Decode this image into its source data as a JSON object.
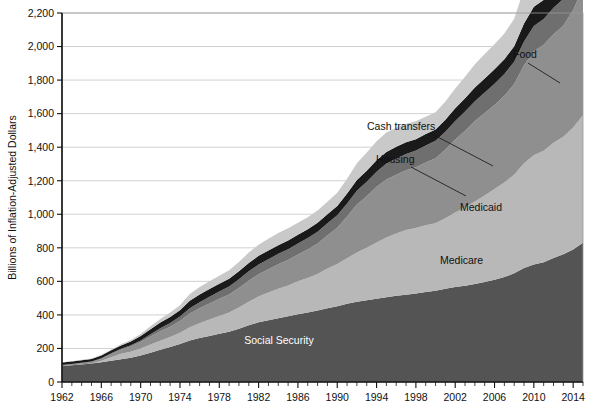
{
  "chart_data": {
    "type": "area",
    "title": "",
    "subtitle": "",
    "xlabel": "",
    "ylabel": "Billions of Inflation-Adjusted Dollars",
    "stacked": true,
    "grid": true,
    "legend_position": "inline-annotations",
    "xlim": [
      1962,
      2015
    ],
    "ylim": [
      0,
      2200
    ],
    "yticks": [
      "0",
      "200",
      "400",
      "600",
      "800",
      "1,000",
      "1,200",
      "1,400",
      "1,600",
      "1,800",
      "2,000",
      "2,200"
    ],
    "ytick_values": [
      0,
      200,
      400,
      600,
      800,
      1000,
      1200,
      1400,
      1600,
      1800,
      2000,
      2200
    ],
    "xticks": [
      "1962",
      "1966",
      "1970",
      "1974",
      "1978",
      "1982",
      "1986",
      "1990",
      "1994",
      "1998",
      "2002",
      "2006",
      "2010",
      "2014"
    ],
    "xtick_values": [
      1962,
      1966,
      1970,
      1974,
      1978,
      1982,
      1986,
      1990,
      1994,
      1998,
      2002,
      2006,
      2010,
      2014
    ],
    "x": [
      1962,
      1963,
      1964,
      1965,
      1966,
      1967,
      1968,
      1969,
      1970,
      1971,
      1972,
      1973,
      1974,
      1975,
      1976,
      1977,
      1978,
      1979,
      1980,
      1981,
      1982,
      1983,
      1984,
      1985,
      1986,
      1987,
      1988,
      1989,
      1990,
      1991,
      1992,
      1993,
      1994,
      1995,
      1996,
      1997,
      1998,
      1999,
      2000,
      2001,
      2002,
      2003,
      2004,
      2005,
      2006,
      2007,
      2008,
      2009,
      2010,
      2011,
      2012,
      2013,
      2014,
      2015
    ],
    "series": [
      {
        "name": "Social Security",
        "color": "#545454",
        "label_position": "inside",
        "values": [
          95,
          100,
          105,
          110,
          118,
          126,
          136,
          145,
          158,
          175,
          192,
          208,
          226,
          248,
          262,
          274,
          288,
          300,
          318,
          338,
          356,
          368,
          380,
          392,
          404,
          414,
          426,
          440,
          452,
          466,
          478,
          488,
          496,
          506,
          514,
          520,
          528,
          536,
          544,
          556,
          566,
          574,
          584,
          596,
          610,
          626,
          648,
          680,
          700,
          714,
          740,
          762,
          790,
          830
        ]
      },
      {
        "name": "Medicare",
        "color": "#b8b8b8",
        "label_position": "inside",
        "values": [
          0,
          0,
          0,
          0,
          8,
          22,
          32,
          36,
          42,
          48,
          54,
          60,
          68,
          78,
          88,
          98,
          106,
          114,
          126,
          140,
          154,
          166,
          176,
          184,
          196,
          206,
          218,
          236,
          252,
          272,
          294,
          312,
          336,
          356,
          372,
          386,
          390,
          398,
          402,
          420,
          444,
          466,
          492,
          516,
          540,
          564,
          588,
          624,
          652,
          664,
          686,
          700,
          728,
          760
        ]
      },
      {
        "name": "Medicaid",
        "color": "#8f8f8f",
        "label_position": "inside",
        "values": [
          5,
          6,
          7,
          9,
          12,
          18,
          24,
          30,
          38,
          48,
          56,
          62,
          70,
          82,
          90,
          96,
          102,
          108,
          116,
          126,
          132,
          138,
          146,
          152,
          160,
          170,
          182,
          198,
          216,
          248,
          286,
          308,
          332,
          346,
          350,
          356,
          362,
          374,
          388,
          410,
          436,
          458,
          480,
          492,
          502,
          516,
          540,
          584,
          620,
          632,
          648,
          662,
          700,
          760
        ]
      },
      {
        "name": "Housing",
        "color": "#6f6f6f",
        "label_position": "callout",
        "values": [
          2,
          2,
          3,
          3,
          4,
          5,
          6,
          8,
          10,
          14,
          18,
          22,
          26,
          32,
          36,
          40,
          44,
          48,
          52,
          56,
          58,
          60,
          62,
          64,
          66,
          68,
          70,
          72,
          74,
          78,
          82,
          86,
          90,
          94,
          96,
          98,
          100,
          102,
          104,
          106,
          110,
          114,
          118,
          122,
          126,
          130,
          134,
          142,
          150,
          154,
          158,
          160,
          164,
          168
        ]
      },
      {
        "name": "Cash transfers",
        "color": "#1a1a1a",
        "label_position": "callout",
        "values": [
          14,
          14,
          15,
          15,
          16,
          18,
          20,
          22,
          26,
          30,
          34,
          36,
          38,
          44,
          46,
          46,
          46,
          46,
          48,
          50,
          52,
          52,
          52,
          52,
          52,
          52,
          54,
          54,
          56,
          60,
          64,
          66,
          68,
          70,
          70,
          70,
          68,
          68,
          68,
          72,
          76,
          80,
          82,
          84,
          86,
          88,
          92,
          108,
          116,
          114,
          112,
          110,
          110,
          112
        ]
      },
      {
        "name": "Food",
        "color": "#c9c9c9",
        "label_position": "callout",
        "values": [
          2,
          2,
          3,
          3,
          4,
          5,
          7,
          9,
          12,
          18,
          22,
          26,
          30,
          40,
          44,
          46,
          48,
          50,
          56,
          62,
          66,
          70,
          72,
          72,
          72,
          72,
          72,
          74,
          78,
          88,
          100,
          108,
          114,
          116,
          114,
          110,
          106,
          104,
          102,
          108,
          118,
          128,
          138,
          146,
          150,
          154,
          164,
          206,
          238,
          254,
          260,
          254,
          250,
          254
        ]
      }
    ],
    "annotations": [
      {
        "label": "Food",
        "x": 513,
        "y": 58
      },
      {
        "label": "Cash transfers",
        "x": 367,
        "y": 130
      },
      {
        "label": "Housing",
        "x": 376,
        "y": 163
      },
      {
        "label": "Medicaid",
        "x": 460,
        "y": 211
      },
      {
        "label": "Medicare",
        "x": 440,
        "y": 264
      },
      {
        "label": "Social Security",
        "x": 279,
        "y": 344
      }
    ]
  }
}
